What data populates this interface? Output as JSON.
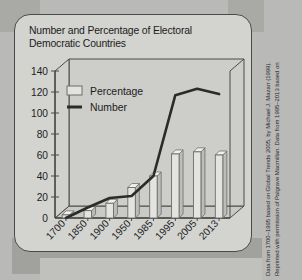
{
  "figure": {
    "title": "Number and Percentage of Electoral Democratic Countries",
    "title_line_1": "Number and Percentage of Electoral",
    "title_line_2": "Democratic Countries"
  },
  "attribution": {
    "line_1": "Data from 1700–1995 based on  Global Trends 2005, by Michael J. Mazarr (1999).",
    "line_2": "Reprinted with permission of Palgrave Macmillan. Data from 1995–2013 based on"
  },
  "legend": {
    "position": "top-left-inside",
    "items": [
      {
        "label": "Percentage",
        "marker": "open-rectangle-swatch",
        "color": "#e8e8e5"
      },
      {
        "label": "Number",
        "marker": "thick-line-swatch",
        "color": "#2b2b2b"
      }
    ]
  },
  "axis": {
    "y_ticks": [
      "140",
      "120",
      "100",
      "80",
      "60",
      "40",
      "20",
      "0"
    ],
    "x_ticks": [
      "1700",
      "1850",
      "1900",
      "1950",
      "1985",
      "1995",
      "2005",
      "2013"
    ]
  },
  "colors": {
    "card_background": "#d3d3d0",
    "page_background": "#b9b9b7",
    "bar_fill": "#e3e3e0",
    "bar_stroke": "#6d6d6b",
    "line": "#2b2b2b",
    "axis": "#4a4a48",
    "text": "#1c1c1c"
  },
  "chart_data": {
    "type": "bar",
    "title": "Number and Percentage of Electoral Democratic Countries",
    "subtitle": "",
    "xlabel": "",
    "ylabel": "",
    "ylim": [
      0,
      140
    ],
    "y_tick_step": 20,
    "grid": false,
    "legend_position": "upper left",
    "three_d": true,
    "categories": [
      "1700",
      "1850",
      "1900",
      "1950",
      "1985",
      "1995",
      "2005",
      "2013"
    ],
    "series": [
      {
        "name": "Percentage",
        "chart_type": "bar",
        "values": [
          3,
          7,
          14,
          29,
          40,
          61,
          63,
          60
        ]
      },
      {
        "name": "Number",
        "chart_type": "line",
        "values": [
          0,
          10,
          19,
          21,
          40,
          117,
          123,
          118
        ]
      }
    ]
  }
}
